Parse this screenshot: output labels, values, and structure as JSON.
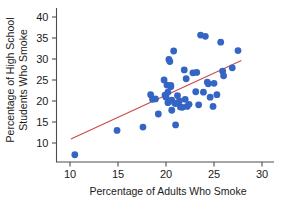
{
  "chart_data": {
    "type": "scatter",
    "title": "",
    "xlabel": "Percentage of Adults Who Smoke",
    "ylabel_line1": "Percentage of High School",
    "ylabel_line2": "Students Who Smoke",
    "ylabel": "Percentage of High School Students Who Smoke",
    "xlim": [
      8.5,
      30.5
    ],
    "ylim": [
      5.0,
      41.5
    ],
    "xticks": [
      10,
      15,
      20,
      25,
      30
    ],
    "xtick_labels": [
      "10",
      "15",
      "20",
      "25",
      "30"
    ],
    "yticks": [
      10,
      15,
      20,
      25,
      30,
      35,
      40
    ],
    "ytick_labels": [
      "10",
      "15",
      "20",
      "25",
      "30",
      "35",
      "40"
    ],
    "grid": false,
    "legend": false,
    "point_color": "#3465c4",
    "point_size": 3.4,
    "trendline": {
      "label": "least-squares regression line",
      "color": "#cc4b48",
      "width": 1.2,
      "x_start": 10.15,
      "y_start": 11.0,
      "x_end": 27.8,
      "y_end": 29.6,
      "slope": 1.053,
      "intercept": 0.31
    },
    "points": [
      {
        "x": 10.5,
        "y": 7.2
      },
      {
        "x": 14.9,
        "y": 13.0
      },
      {
        "x": 17.6,
        "y": 13.8
      },
      {
        "x": 18.4,
        "y": 21.5
      },
      {
        "x": 18.6,
        "y": 20.4
      },
      {
        "x": 18.9,
        "y": 20.5
      },
      {
        "x": 19.2,
        "y": 16.9
      },
      {
        "x": 19.8,
        "y": 25.0
      },
      {
        "x": 19.9,
        "y": 21.4
      },
      {
        "x": 20.0,
        "y": 20.9
      },
      {
        "x": 20.1,
        "y": 23.8
      },
      {
        "x": 20.2,
        "y": 22.1
      },
      {
        "x": 20.2,
        "y": 19.6
      },
      {
        "x": 20.3,
        "y": 29.9
      },
      {
        "x": 20.4,
        "y": 29.4
      },
      {
        "x": 20.5,
        "y": 23.7
      },
      {
        "x": 20.5,
        "y": 23.4
      },
      {
        "x": 20.6,
        "y": 20.2
      },
      {
        "x": 20.6,
        "y": 17.8
      },
      {
        "x": 20.8,
        "y": 31.9
      },
      {
        "x": 20.9,
        "y": 19.5
      },
      {
        "x": 21.0,
        "y": 19.4
      },
      {
        "x": 21.0,
        "y": 14.3
      },
      {
        "x": 21.2,
        "y": 21.3
      },
      {
        "x": 21.4,
        "y": 20.0
      },
      {
        "x": 21.5,
        "y": 18.6
      },
      {
        "x": 21.7,
        "y": 18.5
      },
      {
        "x": 21.9,
        "y": 27.4
      },
      {
        "x": 22.0,
        "y": 20.4
      },
      {
        "x": 22.1,
        "y": 25.3
      },
      {
        "x": 22.2,
        "y": 18.7
      },
      {
        "x": 22.4,
        "y": 19.2
      },
      {
        "x": 22.8,
        "y": 26.7
      },
      {
        "x": 23.1,
        "y": 22.2
      },
      {
        "x": 23.2,
        "y": 26.8
      },
      {
        "x": 23.4,
        "y": 19.1
      },
      {
        "x": 23.6,
        "y": 35.7
      },
      {
        "x": 23.9,
        "y": 22.1
      },
      {
        "x": 24.1,
        "y": 35.4
      },
      {
        "x": 24.3,
        "y": 24.5
      },
      {
        "x": 24.4,
        "y": 24.1
      },
      {
        "x": 24.6,
        "y": 20.9
      },
      {
        "x": 24.9,
        "y": 18.7
      },
      {
        "x": 25.0,
        "y": 24.2
      },
      {
        "x": 25.3,
        "y": 21.5
      },
      {
        "x": 25.7,
        "y": 34.0
      },
      {
        "x": 25.9,
        "y": 27.1
      },
      {
        "x": 26.0,
        "y": 26.0
      },
      {
        "x": 26.9,
        "y": 27.9
      },
      {
        "x": 27.5,
        "y": 32.0
      }
    ]
  }
}
